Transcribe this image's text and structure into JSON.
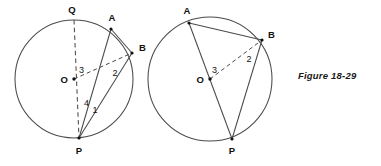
{
  "figure": {
    "caption": "Figure 18-29",
    "domain": "geometry-diagram",
    "stroke_color": "#4a4a4a",
    "text_color": "#111111",
    "background": "#ffffff"
  },
  "diagrams": [
    {
      "id": "left-circle",
      "center": {
        "label": "O",
        "x": 74,
        "y": 79
      },
      "radius": 59,
      "points": [
        {
          "label": "Q",
          "x": 74,
          "y": 20,
          "label_x": 72,
          "label_y": 13,
          "marked": false
        },
        {
          "label": "A",
          "x": 111,
          "y": 29,
          "label_x": 112,
          "label_y": 21,
          "marked": true
        },
        {
          "label": "B",
          "x": 132,
          "y": 53,
          "label_x": 139,
          "label_y": 51,
          "marked": true
        },
        {
          "label": "P",
          "x": 79,
          "y": 138,
          "label_x": 79,
          "label_y": 154,
          "marked": true
        }
      ],
      "segments": [
        {
          "name": "QP-diameter",
          "from": "Q",
          "to": "P",
          "style": "dashed"
        },
        {
          "name": "OB-radius",
          "from": "O",
          "to": "B",
          "style": "dashed"
        },
        {
          "name": "AP-chord",
          "from": "A",
          "to": "P",
          "style": "solid"
        },
        {
          "name": "BP-chord",
          "from": "B",
          "to": "P",
          "style": "solid"
        },
        {
          "name": "AB-arc-chord",
          "from": "A",
          "to": "B",
          "style": "solid"
        }
      ],
      "angle_labels": [
        {
          "label": "3",
          "x": 79,
          "y": 73
        },
        {
          "label": "2",
          "x": 115,
          "y": 76
        },
        {
          "label": "4",
          "x": 84,
          "y": 106
        },
        {
          "label": "1",
          "x": 95,
          "y": 113
        }
      ]
    },
    {
      "id": "right-circle",
      "center": {
        "label": "O",
        "x": 210,
        "y": 79
      },
      "radius": 62,
      "points": [
        {
          "label": "A",
          "x": 189,
          "y": 23,
          "label_x": 187,
          "label_y": 14,
          "marked": true
        },
        {
          "label": "B",
          "x": 262,
          "y": 40,
          "label_x": 268,
          "label_y": 38,
          "marked": true
        },
        {
          "label": "P",
          "x": 232,
          "y": 139,
          "label_x": 232,
          "label_y": 154,
          "marked": true
        }
      ],
      "segments": [
        {
          "name": "AP-chord-through-O",
          "from": "A",
          "to": "P",
          "style": "solid"
        },
        {
          "name": "OB-radius",
          "from": "O",
          "to": "B",
          "style": "dashed"
        },
        {
          "name": "BP-chord",
          "from": "B",
          "to": "P",
          "style": "solid"
        },
        {
          "name": "AB-chord",
          "from": "A",
          "to": "B",
          "style": "solid"
        }
      ],
      "angle_labels": [
        {
          "label": "3",
          "x": 212,
          "y": 73
        },
        {
          "label": "2",
          "x": 249,
          "y": 62
        }
      ]
    }
  ]
}
